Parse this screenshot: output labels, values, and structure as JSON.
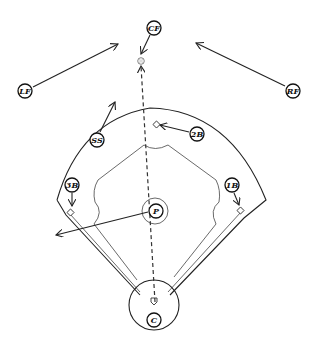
{
  "diagram": {
    "colors": {
      "ink": "#222222",
      "background": "#ffffff"
    },
    "positions": [
      {
        "id": "cf",
        "label": "CF",
        "x": 154,
        "y": 28
      },
      {
        "id": "lf",
        "label": "LF",
        "x": 25,
        "y": 91
      },
      {
        "id": "rf",
        "label": "RF",
        "x": 293,
        "y": 91
      },
      {
        "id": "ss",
        "label": "SS",
        "x": 97,
        "y": 140
      },
      {
        "id": "2b",
        "label": "2B",
        "x": 197,
        "y": 134
      },
      {
        "id": "3b",
        "label": "3B",
        "x": 72,
        "y": 185
      },
      {
        "id": "1b",
        "label": "1B",
        "x": 232,
        "y": 185
      },
      {
        "id": "p",
        "label": "P",
        "x": 156,
        "y": 211
      },
      {
        "id": "c",
        "label": "C",
        "x": 154,
        "y": 320
      }
    ],
    "ball_marker": {
      "icon": "baseball-icon",
      "x": 141,
      "y": 61
    },
    "flight_path": {
      "style": "dashed",
      "from": "home plate",
      "to": "ball"
    }
  }
}
